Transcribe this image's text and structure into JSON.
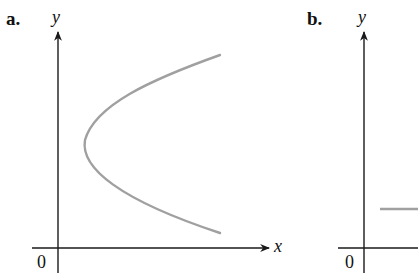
{
  "panels": [
    {
      "label": "a.",
      "y_axis_label": "y",
      "x_axis_label": "x",
      "origin_label": "0",
      "curve": "sideways parabola opening right (x = y^2 form)",
      "curve_color": "#a0a0a0"
    },
    {
      "label": "b.",
      "y_axis_label": "y",
      "origin_label": "0",
      "curve": "horizontal line segment (partially visible)",
      "curve_color": "#a0a0a0"
    }
  ],
  "colors": {
    "axis": "#1a1a1a",
    "curve": "#a0a0a0",
    "background": "#ffffff"
  }
}
